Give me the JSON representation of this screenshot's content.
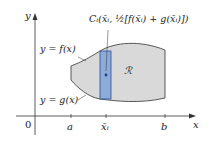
{
  "diagram": {
    "axes": {
      "y_label": "y",
      "x_label": "x",
      "origin_label": "0",
      "x_ticks": [
        {
          "label": "a"
        },
        {
          "label": "x̄ᵢ"
        },
        {
          "label": "b"
        }
      ]
    },
    "curves": {
      "upper_label": "y = f(x)",
      "lower_label": "y = g(x)"
    },
    "region_label": "ℛ",
    "centroid_label": "Cᵢ(x̄ᵢ, ½[f(x̄ᵢ) + g(x̄ᵢ)])",
    "colors": {
      "region_fill": "#d9d9d9",
      "region_stroke": "#333333",
      "strip_fill": "#7fa2d6",
      "strip_stroke": "#2a4f9a",
      "point": "#1f3f8f",
      "axis": "#333333"
    }
  }
}
